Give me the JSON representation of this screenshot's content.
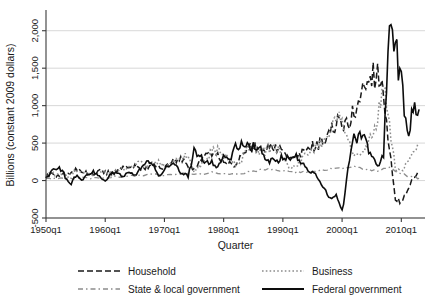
{
  "chart_data": {
    "type": "line",
    "title": "",
    "xlabel": "Quarter",
    "ylabel": "Billions (constant 2009 dollars)",
    "xlim": [
      1950,
      2014
    ],
    "ylim": [
      -500,
      2250
    ],
    "yticks": [
      -500,
      0,
      500,
      1000,
      1500,
      2000
    ],
    "ytick_labels": [
      "-500",
      "0",
      "500",
      "1,000",
      "1,500",
      "2,000"
    ],
    "xticks": [
      1950,
      1960,
      1970,
      1980,
      1990,
      2000,
      2010
    ],
    "xtick_labels": [
      "1950q1",
      "1960q1",
      "1970q1",
      "1980q1",
      "1990q1",
      "2000q1",
      "2010q1"
    ],
    "grid": "horizontal",
    "legend_position": "below",
    "colors": {
      "household": "#1a1a1a",
      "business": "#8c8c8c",
      "state_local": "#8c8c8c",
      "federal": "#0d0d0d",
      "gridline": "#d3d3d3",
      "axis": "#3a3a3a",
      "background": "#ffffff"
    },
    "series": [
      {
        "name": "Household",
        "dash": "6,3",
        "width": 1.5,
        "color": "#1a1a1a",
        "x": [
          1950,
          1951,
          1952,
          1953,
          1954,
          1955,
          1956,
          1957,
          1958,
          1959,
          1960,
          1961,
          1962,
          1963,
          1964,
          1965,
          1966,
          1967,
          1968,
          1969,
          1970,
          1971,
          1972,
          1973,
          1974,
          1975,
          1976,
          1977,
          1978,
          1979,
          1980,
          1981,
          1982,
          1983,
          1984,
          1985,
          1986,
          1987,
          1988,
          1989,
          1990,
          1991,
          1992,
          1993,
          1994,
          1995,
          1996,
          1997,
          1998,
          1999,
          2000,
          2001,
          2002,
          2003,
          2004,
          2005,
          2006,
          2007,
          2008,
          2009,
          2010,
          2011,
          2012,
          2013
        ],
        "values": [
          60,
          85,
          70,
          95,
          80,
          150,
          120,
          95,
          70,
          140,
          110,
          95,
          135,
          165,
          175,
          190,
          160,
          175,
          210,
          195,
          160,
          240,
          280,
          290,
          200,
          160,
          255,
          330,
          380,
          360,
          230,
          250,
          180,
          330,
          430,
          470,
          450,
          420,
          480,
          440,
          380,
          270,
          300,
          350,
          420,
          460,
          480,
          540,
          660,
          780,
          720,
          760,
          900,
          1130,
          1280,
          1420,
          1480,
          1180,
          420,
          -230,
          -310,
          -160,
          30,
          110
        ]
      },
      {
        "name": "Business",
        "dash": "1.6,2.2",
        "width": 1.5,
        "color": "#8c8c8c",
        "x": [
          1950,
          1951,
          1952,
          1953,
          1954,
          1955,
          1956,
          1957,
          1958,
          1959,
          1960,
          1961,
          1962,
          1963,
          1964,
          1965,
          1966,
          1967,
          1968,
          1969,
          1970,
          1971,
          1972,
          1973,
          1974,
          1975,
          1976,
          1977,
          1978,
          1979,
          1980,
          1981,
          1982,
          1983,
          1984,
          1985,
          1986,
          1987,
          1988,
          1989,
          1990,
          1991,
          1992,
          1993,
          1994,
          1995,
          1996,
          1997,
          1998,
          1999,
          2000,
          2001,
          2002,
          2003,
          2004,
          2005,
          2006,
          2007,
          2008,
          2009,
          2010,
          2011,
          2012,
          2013
        ],
        "values": [
          55,
          90,
          65,
          80,
          60,
          130,
          115,
          100,
          55,
          125,
          105,
          90,
          140,
          150,
          170,
          210,
          230,
          190,
          240,
          260,
          200,
          210,
          280,
          340,
          330,
          120,
          200,
          290,
          380,
          420,
          330,
          330,
          200,
          240,
          470,
          440,
          400,
          390,
          450,
          420,
          330,
          180,
          200,
          260,
          340,
          430,
          470,
          560,
          700,
          790,
          860,
          560,
          330,
          320,
          430,
          600,
          830,
          1170,
          780,
          160,
          120,
          240,
          330,
          470
        ]
      },
      {
        "name": "State & local government",
        "dash": "5,3,1.5,3",
        "width": 1.3,
        "color": "#8c8c8c",
        "x": [
          1950,
          1952,
          1954,
          1956,
          1958,
          1960,
          1962,
          1964,
          1966,
          1968,
          1970,
          1972,
          1974,
          1976,
          1978,
          1980,
          1982,
          1984,
          1986,
          1988,
          1990,
          1992,
          1994,
          1996,
          1998,
          2000,
          2002,
          2004,
          2006,
          2008,
          2010,
          2012,
          2013
        ],
        "values": [
          20,
          25,
          30,
          40,
          35,
          45,
          55,
          60,
          70,
          80,
          75,
          95,
          100,
          85,
          105,
          95,
          80,
          110,
          140,
          150,
          130,
          110,
          120,
          130,
          150,
          160,
          190,
          150,
          130,
          180,
          90,
          40,
          30
        ]
      },
      {
        "name": "Federal government",
        "dash": "none",
        "width": 1.6,
        "color": "#0d0d0d",
        "x": [
          1950,
          1951,
          1952,
          1953,
          1954,
          1955,
          1956,
          1957,
          1958,
          1959,
          1960,
          1961,
          1962,
          1963,
          1964,
          1965,
          1966,
          1967,
          1968,
          1969,
          1970,
          1971,
          1972,
          1973,
          1974,
          1975,
          1976,
          1977,
          1978,
          1979,
          1980,
          1981,
          1982,
          1983,
          1984,
          1985,
          1986,
          1987,
          1988,
          1989,
          1990,
          1991,
          1992,
          1993,
          1994,
          1995,
          1996,
          1997,
          1998,
          1999,
          2000,
          2001,
          2002,
          2003,
          2004,
          2005,
          2006,
          2007,
          2008,
          2009,
          2010,
          2011,
          2012,
          2013
        ],
        "values": [
          40,
          120,
          180,
          90,
          -60,
          70,
          30,
          60,
          110,
          40,
          -20,
          90,
          120,
          60,
          100,
          70,
          180,
          260,
          230,
          60,
          150,
          220,
          190,
          80,
          60,
          390,
          330,
          260,
          240,
          180,
          320,
          280,
          430,
          480,
          440,
          470,
          430,
          280,
          270,
          260,
          330,
          300,
          330,
          250,
          150,
          120,
          20,
          -110,
          -230,
          -180,
          -450,
          170,
          560,
          620,
          520,
          330,
          200,
          330,
          2250,
          1700,
          1450,
          600,
          900,
          950
        ]
      }
    ]
  },
  "legend": {
    "items": [
      {
        "label": "Household",
        "style": "dashed",
        "color": "#1a1a1a"
      },
      {
        "label": "Business",
        "style": "dotted",
        "color": "#8c8c8c"
      },
      {
        "label": "State & local government",
        "style": "dash-dot",
        "color": "#8c8c8c"
      },
      {
        "label": "Federal government",
        "style": "solid",
        "color": "#0d0d0d"
      }
    ]
  }
}
